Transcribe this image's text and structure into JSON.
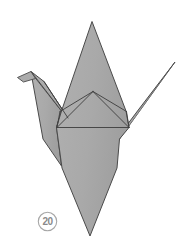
{
  "figure": {
    "background_color": "#ffffff",
    "paper_fill": "#a9a9a9",
    "paper_fill_shadow": "#9d9d9d",
    "outline_color": "#4a4a4a",
    "crease_color": "#3c3c3c",
    "canvas": {
      "width": 186,
      "height": 244
    }
  },
  "step_badge": {
    "label": "20",
    "shape": "circle",
    "text_color": "#8a8a8a",
    "ring_color": "#a6a6a6",
    "fill_color": "#ffffff",
    "center": {
      "x": 10.5,
      "y": 10.5
    },
    "radius": 9.2
  },
  "shapes": {
    "body_outline": "M 92,22 L 125,110 L 128,128 L 120,138 L 118,168 L 90,236 L 62,168 L 56,128 L 62,110 Z",
    "left_wing": "M 30,72 L 62,110 L 56,128 L 62,168 L 44,140 Z",
    "beak_upper": "M 18,77 L 30,72 L 34,77 L 24,82 Z",
    "head_neck": "M 30,72 L 43,81 L 66,117 L 56,128 L 62,110 Z",
    "right_wing": "M 175,62 L 128,128 L 120,138 L 140,112 Z",
    "right_wing_inner": "M 175,62 L 128,128 L 134,120 Z",
    "center_peak": "M 93,92 L 128,128 L 56,128 Z"
  },
  "creases": [
    {
      "name": "peak-to-left-shoulder",
      "from": {
        "x": 93,
        "y": 92
      },
      "to": {
        "x": 60,
        "y": 112
      }
    },
    {
      "name": "peak-to-right-shoulder",
      "from": {
        "x": 93,
        "y": 92
      },
      "to": {
        "x": 126,
        "y": 112
      }
    },
    {
      "name": "peak-to-left-corner",
      "from": {
        "x": 93,
        "y": 92
      },
      "to": {
        "x": 57,
        "y": 127
      }
    },
    {
      "name": "peak-to-right-corner",
      "from": {
        "x": 93,
        "y": 92
      },
      "to": {
        "x": 129,
        "y": 127
      }
    },
    {
      "name": "horizontal-base-fold",
      "from": {
        "x": 57,
        "y": 127
      },
      "to": {
        "x": 129,
        "y": 127
      }
    },
    {
      "name": "left-shoulder-to-corner",
      "from": {
        "x": 60,
        "y": 112
      },
      "to": {
        "x": 57,
        "y": 127
      }
    },
    {
      "name": "right-shoulder-to-corner",
      "from": {
        "x": 126,
        "y": 112
      },
      "to": {
        "x": 129,
        "y": 127
      }
    },
    {
      "name": "neck-upper-edge",
      "from": {
        "x": 30,
        "y": 72
      },
      "to": {
        "x": 60,
        "y": 112
      }
    },
    {
      "name": "neck-lower-edge",
      "from": {
        "x": 34,
        "y": 79
      },
      "to": {
        "x": 57,
        "y": 127
      }
    }
  ],
  "landmarks": [
    {
      "name": "top-peak",
      "x": 92,
      "y": 22
    },
    {
      "name": "bottom-tip",
      "x": 90,
      "y": 236
    },
    {
      "name": "beak-tip",
      "x": 18,
      "y": 77
    },
    {
      "name": "head-apex",
      "x": 30,
      "y": 72
    },
    {
      "name": "right-wing-tip",
      "x": 175,
      "y": 62
    },
    {
      "name": "center-crease-peak",
      "x": 93,
      "y": 92
    },
    {
      "name": "left-wing-corner",
      "x": 44,
      "y": 140
    },
    {
      "name": "right-wing-notch",
      "x": 128,
      "y": 128
    }
  ]
}
